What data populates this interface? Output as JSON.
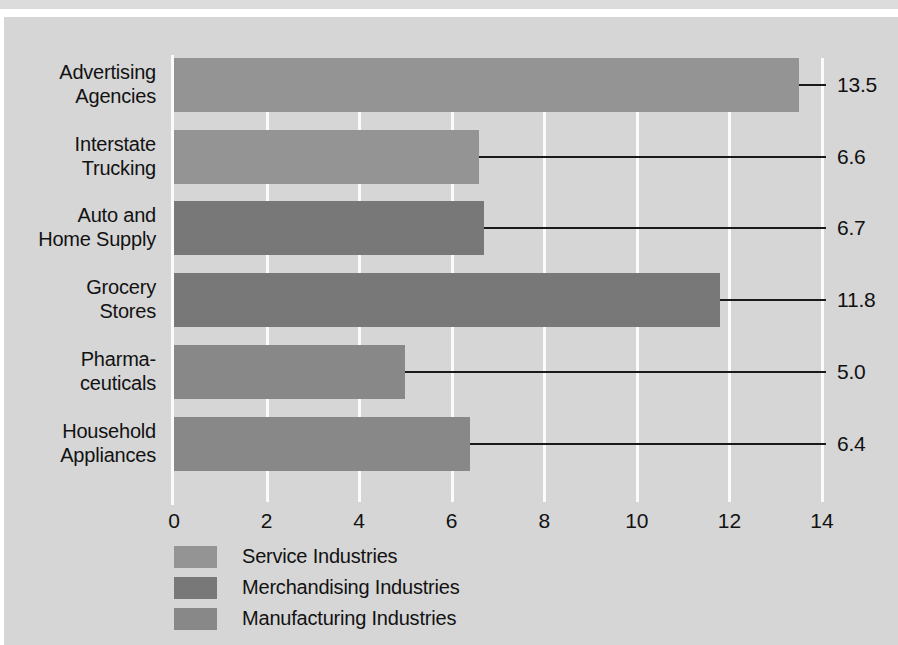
{
  "chart_data": {
    "type": "bar",
    "orientation": "horizontal",
    "title": "",
    "xlabel": "",
    "ylabel": "",
    "xlim": [
      0,
      14
    ],
    "xticks": [
      "0",
      "2",
      "4",
      "6",
      "8",
      "10",
      "12",
      "14"
    ],
    "xtick_values": [
      0,
      2,
      4,
      6,
      8,
      10,
      12,
      14
    ],
    "grid": true,
    "legend_position": "bottom-left",
    "categories": [
      "Advertising Agencies",
      "Interstate Trucking",
      "Auto and Home Supply",
      "Grocery Stores",
      "Pharmaceuticals",
      "Household Appliances"
    ],
    "values": [
      13.5,
      6.6,
      6.7,
      11.8,
      5.0,
      6.4
    ],
    "value_labels": [
      "13.5",
      "6.6",
      "6.7",
      "11.8",
      "5.0",
      "6.4"
    ],
    "bar_groups": [
      "Service Industries",
      "Service Industries",
      "Merchandising Industries",
      "Merchandising Industries",
      "Manufacturing Industries",
      "Manufacturing Industries"
    ],
    "legend": [
      {
        "label": "Service Industries",
        "color": "#949494"
      },
      {
        "label": "Merchandising Industries",
        "color": "#787878"
      },
      {
        "label": "Manufacturing Industries",
        "color": "#888888"
      }
    ]
  },
  "bars": [
    {
      "label_lines": [
        "Advertising",
        "Agencies"
      ],
      "value": 13.5,
      "value_label": "13.5",
      "color": "#949494",
      "series": "Service Industries"
    },
    {
      "label_lines": [
        "Interstate",
        "Trucking"
      ],
      "value": 6.6,
      "value_label": "6.6",
      "color": "#949494",
      "series": "Service Industries"
    },
    {
      "label_lines": [
        "Auto and",
        "Home Supply"
      ],
      "value": 6.7,
      "value_label": "6.7",
      "color": "#787878",
      "series": "Merchandising Industries"
    },
    {
      "label_lines": [
        "Grocery",
        "Stores"
      ],
      "value": 11.8,
      "value_label": "11.8",
      "color": "#787878",
      "series": "Merchandising Industries"
    },
    {
      "label_lines": [
        "Pharma-",
        "ceuticals"
      ],
      "value": 5.0,
      "value_label": "5.0",
      "color": "#888888",
      "series": "Manufacturing Industries"
    },
    {
      "label_lines": [
        "Household",
        "Appliances"
      ],
      "value": 6.4,
      "value_label": "6.4",
      "color": "#888888",
      "series": "Manufacturing Industries"
    }
  ],
  "axis": {
    "ticks": [
      "0",
      "2",
      "4",
      "6",
      "8",
      "10",
      "12",
      "14"
    ]
  },
  "legend": {
    "items": [
      {
        "label": "Service Industries",
        "color": "#949494"
      },
      {
        "label": "Merchandising Industries",
        "color": "#787878"
      },
      {
        "label": "Manufacturing Industries",
        "color": "#888888"
      }
    ]
  },
  "colors": {
    "panel_background": "#d6d6d6",
    "page_background": "#ffffff",
    "gridline": "#fbfbfb",
    "text": "#121212",
    "leader_line": "#1a1a1a",
    "service": "#949494",
    "merchandising": "#787878",
    "manufacturing": "#888888"
  }
}
